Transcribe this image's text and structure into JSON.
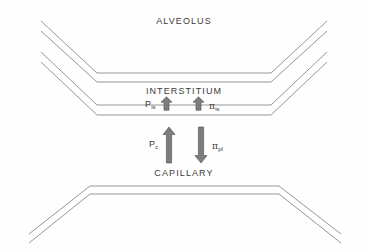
{
  "diagram": {
    "title_regions": {
      "alveolus": "ALVEOLUS",
      "interstitium": "INTERSTITIUM",
      "capillary": "CAPILLARY"
    },
    "forces": [
      {
        "id": "p-is",
        "symbol": "P",
        "subscript": "is",
        "direction": "up",
        "size": "small",
        "compartment": "interstitium"
      },
      {
        "id": "pi-is",
        "symbol": "π",
        "subscript": "is",
        "direction": "up",
        "size": "small",
        "compartment": "interstitium"
      },
      {
        "id": "p-c",
        "symbol": "P",
        "subscript": "c",
        "direction": "up",
        "size": "large",
        "compartment": "capillary"
      },
      {
        "id": "pi-pl",
        "symbol": "π",
        "subscript": "pl",
        "direction": "down",
        "size": "large",
        "compartment": "capillary"
      }
    ],
    "colors": {
      "line": "#8a8a8a",
      "text": "#3a3a3a",
      "arrow_fill": "#7d7d7d",
      "arrow_stroke": "#5d5d5d",
      "background": "#fefefe"
    },
    "geometry": {
      "alveolar_wall_lines": [
        "M 41,21 L 97,73 L 271,73 L 327,21",
        "M 41,31 L 97,82 L 271,82 L 327,31",
        "M 41,52 L 97,105 L 271,105 L 327,52",
        "M 41,62 L 97,115 L 271,115 L 327,62"
      ],
      "capillary_wall_lines": [
        "M 29,234 L 90,186 L 279,186 L 341,234",
        "M 29,243 L 90,194 L 279,194 L 341,243"
      ]
    }
  }
}
